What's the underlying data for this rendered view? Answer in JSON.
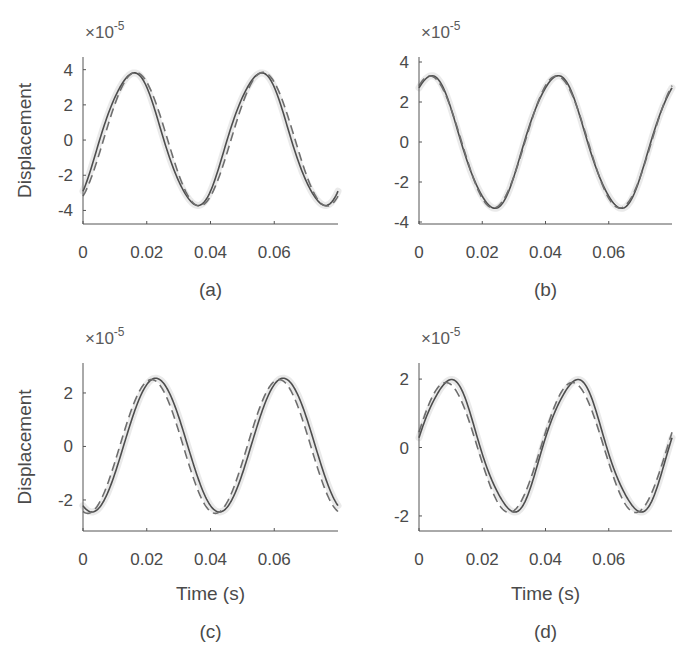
{
  "figure": {
    "width": 686,
    "height": 660,
    "colors": {
      "axis": "#555555",
      "solid_line": "#4d4d4d",
      "dashed_line": "#6e6e6e",
      "halo": "#d9d9d9",
      "text": "#4a4a4a"
    }
  },
  "chart_data": [
    {
      "type": "line",
      "panel_label": "(a)",
      "title": "",
      "xlabel": "",
      "ylabel": "Displacement",
      "y_multiplier": "×10^-5",
      "xlim": [
        0,
        0.08
      ],
      "ylim": [
        -4.77,
        4.72
      ],
      "xticks": [
        0,
        0.02,
        0.04,
        0.06
      ],
      "xtick_labels": [
        "0",
        "0.02",
        "0.04",
        "0.06"
      ],
      "yticks": [
        -4,
        -2,
        0,
        2,
        4
      ],
      "ytick_labels": [
        "-4",
        "-2",
        "0",
        "2",
        "4"
      ],
      "grid": false,
      "legend": null,
      "box": {
        "x0": 83,
        "x1": 338,
        "y_top": 57,
        "y_bottom": 224
      },
      "series": [
        {
          "name": "measured",
          "style": "solid",
          "amplitude": 3.75,
          "period": 0.04,
          "peak_time": 0.0155,
          "offset": 0.05,
          "harmonic": 0.35,
          "start_value": -3.0,
          "end_value": -3.3
        },
        {
          "name": "model",
          "style": "dashed",
          "amplitude": 3.8,
          "period": 0.04,
          "peak_time": 0.0165,
          "offset": 0.05,
          "harmonic": 0.0,
          "start_value": -3.0,
          "end_value": -3.4
        }
      ],
      "key_points": {
        "peaks": [
          [
            0.0155,
            3.8
          ],
          [
            0.0555,
            3.8
          ]
        ],
        "troughs": [
          [
            0.0355,
            -3.7
          ],
          [
            0.076,
            -3.7
          ]
        ]
      }
    },
    {
      "type": "line",
      "panel_label": "(b)",
      "title": "",
      "xlabel": "",
      "ylabel": "",
      "y_multiplier": "×10^-5",
      "xlim": [
        0,
        0.08
      ],
      "ylim": [
        -4.1,
        4.25
      ],
      "xticks": [
        0,
        0.02,
        0.04,
        0.06
      ],
      "xtick_labels": [
        "0",
        "0.02",
        "0.04",
        "0.06"
      ],
      "yticks": [
        -4,
        -2,
        0,
        2,
        4
      ],
      "ytick_labels": [
        "-4",
        "-2",
        "0",
        "2",
        "4"
      ],
      "grid": false,
      "legend": null,
      "box": {
        "x0": 419,
        "x1": 672,
        "y_top": 57,
        "y_bottom": 224
      },
      "series": [
        {
          "name": "measured",
          "style": "solid",
          "amplitude": 3.3,
          "period": 0.04,
          "peak_time": 0.0035,
          "offset": 0.0,
          "harmonic": 0.3,
          "start_value": 2.6,
          "end_value": 2.2
        },
        {
          "name": "model",
          "style": "dashed",
          "amplitude": 3.3,
          "period": 0.04,
          "peak_time": 0.0035,
          "offset": 0.0,
          "harmonic": 0.0,
          "start_value": 3.0,
          "end_value": 2.7
        }
      ],
      "key_points": {
        "peaks": [
          [
            0.0035,
            3.3
          ],
          [
            0.0435,
            3.3
          ]
        ],
        "troughs": [
          [
            0.0235,
            -3.3
          ],
          [
            0.0635,
            -3.3
          ]
        ]
      }
    },
    {
      "type": "line",
      "panel_label": "(c)",
      "title": "",
      "xlabel": "Time (s)",
      "ylabel": "Displacement",
      "y_multiplier": "×10^-5",
      "xlim": [
        0,
        0.08
      ],
      "ylim": [
        -3.16,
        3.12
      ],
      "xticks": [
        0,
        0.02,
        0.04,
        0.06
      ],
      "xtick_labels": [
        "0",
        "0.02",
        "0.04",
        "0.06"
      ],
      "yticks": [
        -2,
        0,
        2
      ],
      "ytick_labels": [
        "-2",
        "0",
        "2"
      ],
      "grid": false,
      "legend": null,
      "box": {
        "x0": 83,
        "x1": 338,
        "y_top": 363,
        "y_bottom": 531
      },
      "series": [
        {
          "name": "measured",
          "style": "solid",
          "amplitude": 2.5,
          "period": 0.04,
          "peak_time": 0.0228,
          "offset": 0.05,
          "harmonic": 0.0,
          "start_value": -2.35,
          "end_value": -2.35
        },
        {
          "name": "model",
          "style": "dashed",
          "amplitude": 2.5,
          "period": 0.04,
          "peak_time": 0.0215,
          "offset": 0.0,
          "harmonic": 0.0,
          "start_value": -2.4,
          "end_value": -2.2
        }
      ],
      "key_points": {
        "peaks": [
          [
            0.0225,
            2.5
          ],
          [
            0.0625,
            2.5
          ]
        ],
        "troughs": [
          [
            0.0025,
            -2.4
          ],
          [
            0.0425,
            -2.4
          ]
        ]
      }
    },
    {
      "type": "line",
      "panel_label": "(d)",
      "title": "",
      "xlabel": "Time (s)",
      "ylabel": "",
      "y_multiplier": "×10^-5",
      "xlim": [
        0,
        0.08
      ],
      "ylim": [
        -2.44,
        2.47
      ],
      "xticks": [
        0,
        0.02,
        0.04,
        0.06
      ],
      "xtick_labels": [
        "0",
        "0.02",
        "0.04",
        "0.06"
      ],
      "yticks": [
        -2,
        0,
        2
      ],
      "ytick_labels": [
        "-2",
        "0",
        "2"
      ],
      "grid": false,
      "legend": null,
      "box": {
        "x0": 419,
        "x1": 672,
        "y_top": 363,
        "y_bottom": 531
      },
      "series": [
        {
          "name": "measured",
          "style": "solid",
          "amplitude": 1.92,
          "period": 0.04,
          "peak_time": 0.0095,
          "offset": 0.05,
          "harmonic": 0.25,
          "start_value": 0.0,
          "end_value": -0.6
        },
        {
          "name": "model",
          "style": "dashed",
          "amplitude": 1.9,
          "period": 0.04,
          "peak_time": 0.0085,
          "offset": 0.0,
          "harmonic": 0.0,
          "start_value": 0.5,
          "end_value": 0.3
        }
      ],
      "key_points": {
        "peaks": [
          [
            0.009,
            1.95
          ],
          [
            0.049,
            1.95
          ]
        ],
        "troughs": [
          [
            0.029,
            -1.85
          ],
          [
            0.069,
            -1.85
          ]
        ]
      }
    }
  ]
}
